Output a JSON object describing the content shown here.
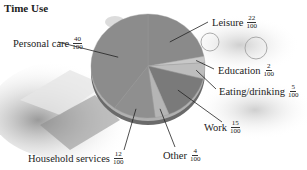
{
  "chart_data": {
    "type": "pie",
    "title": "Time Use",
    "categories": [
      "Leisure",
      "Education",
      "Eating/drinking",
      "Work",
      "Other",
      "Household services",
      "Personal care"
    ],
    "values": [
      22,
      2,
      5,
      15,
      4,
      12,
      40
    ],
    "value_labels": [
      {
        "num": "22",
        "den": "100"
      },
      {
        "num": "2",
        "den": "100"
      },
      {
        "num": "5",
        "den": "100"
      },
      {
        "num": "15",
        "den": "100"
      },
      {
        "num": "4",
        "den": "100"
      },
      {
        "num": "12",
        "den": "100"
      },
      {
        "num": "40",
        "den": "100"
      }
    ],
    "colors": [
      "#8a8a8a",
      "#c8c8c8",
      "#bdbdbd",
      "#7a7a7a",
      "#b5b5b5",
      "#8f8f8f",
      "#8c8c8c"
    ],
    "start_angle_deg": 0,
    "direction": "clockwise",
    "legend": "none (leader-line labels)"
  },
  "labels": {
    "leisure": {
      "name": "Leisure",
      "num": "22",
      "den": "100"
    },
    "education": {
      "name": "Education",
      "num": "2",
      "den": "100"
    },
    "eating": {
      "name": "Eating/drinking",
      "num": "5",
      "den": "100"
    },
    "work": {
      "name": "Work",
      "num": "15",
      "den": "100"
    },
    "other": {
      "name": "Other",
      "num": "4",
      "den": "100"
    },
    "household": {
      "name": "Household services",
      "num": "12",
      "den": "100"
    },
    "personal": {
      "name": "Personal care",
      "num": "40",
      "den": "100"
    }
  }
}
